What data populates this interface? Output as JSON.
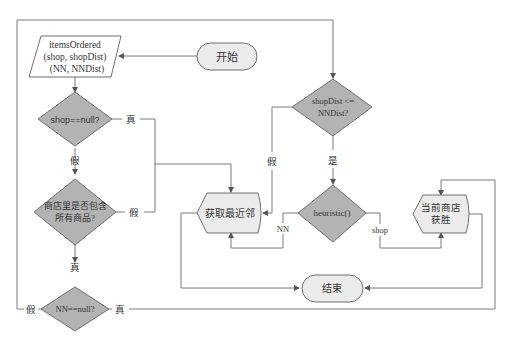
{
  "nodes": {
    "start": {
      "label": "开始",
      "type": "terminal"
    },
    "io": {
      "lines": [
        "itemsOrdered",
        "(shop, shopDist)",
        "(NN, NNDist)"
      ],
      "type": "data"
    },
    "shop_null": {
      "label": "shop==null?",
      "type": "decision"
    },
    "contains_all": {
      "lines": [
        "商店里是否包含",
        "所有商品?"
      ],
      "type": "decision"
    },
    "nn_null": {
      "label": "NN==null?",
      "type": "decision"
    },
    "dist_compare": {
      "lines": [
        "shopDist <=",
        "NNDist?"
      ],
      "type": "decision"
    },
    "get_neighbor": {
      "label": "获取最近邻",
      "type": "preparation"
    },
    "heuristic": {
      "label": "heuristic()",
      "type": "decision"
    },
    "shop_wins": {
      "lines": [
        "当前商店",
        "获胜"
      ],
      "type": "preparation"
    },
    "end": {
      "label": "结束",
      "type": "terminal"
    }
  },
  "edge_labels": {
    "shop_null_true": "真",
    "shop_null_false": "假",
    "contains_false": "假",
    "contains_true": "真",
    "nn_null_false": "假",
    "nn_null_true": "真",
    "compare_false": "假",
    "compare_true": "是",
    "heuristic_nn": "NN",
    "heuristic_shop": "shop"
  },
  "colors": {
    "decision_fill": "#b3b3b3",
    "process_fill": "#ebebeb",
    "stroke": "#6e6e6e",
    "edge": "#7a7a7a"
  }
}
